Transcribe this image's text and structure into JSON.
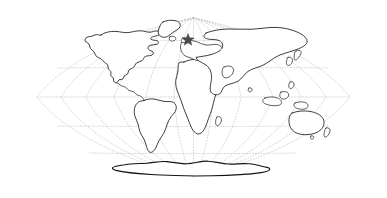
{
  "figure": {
    "kind": "world-map",
    "title": "",
    "caption": "",
    "background_color": "#ffffff"
  },
  "map": {
    "projection": "oval-equal-area",
    "outline_color": "#1b1b1b",
    "land_fill_color": "#ffffff",
    "graticule_color": "#b9b9b9",
    "graticule_style": "dotted",
    "width": 387,
    "height": 198,
    "ellipse": {
      "center_x": 193.5,
      "center_y": 97,
      "radius_x": 157,
      "radius_y": 79
    },
    "graticule": {
      "meridian_interval_degrees": 30,
      "parallel_interval_degrees": 30,
      "meridian_count": 11,
      "parallel_count": 5
    },
    "landmasses": [
      {
        "name": "north-america"
      },
      {
        "name": "greenland"
      },
      {
        "name": "south-america"
      },
      {
        "name": "africa"
      },
      {
        "name": "europe"
      },
      {
        "name": "asia"
      },
      {
        "name": "australia"
      },
      {
        "name": "antarctica"
      },
      {
        "name": "british-isles"
      },
      {
        "name": "japan"
      },
      {
        "name": "madagascar"
      },
      {
        "name": "new-zealand"
      },
      {
        "name": "indonesia"
      },
      {
        "name": "iceland"
      },
      {
        "name": "philippines"
      },
      {
        "name": "sri-lanka"
      }
    ]
  },
  "markers": [
    {
      "name": "location-star",
      "shape": "star",
      "label": "",
      "color": "#4a4a4a",
      "x": 188,
      "y": 40,
      "size": 13,
      "points": 5,
      "region": "western-europe"
    }
  ],
  "legend": {
    "visible": false,
    "entries": []
  },
  "annotations": []
}
